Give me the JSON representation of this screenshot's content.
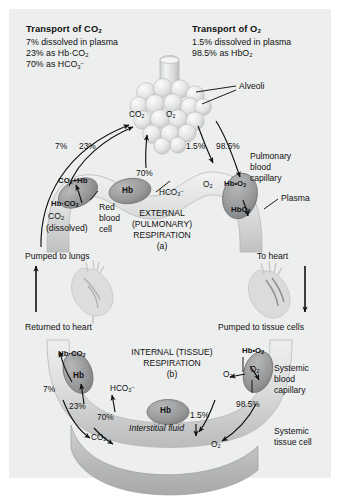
{
  "figure": {
    "title_co2": "Transport of CO2",
    "title_o2": "Transport of O2",
    "co2_facts": [
      "7% dissolved in plasma",
      "23% as Hb·CO2",
      "70% as HCO3-"
    ],
    "o2_facts": [
      "1.5% dissolved in plasma",
      "98.5% as HbO2"
    ]
  },
  "top_loop": {
    "caption_line1": "EXTERNAL",
    "caption_line2": "(PULMONARY)",
    "caption_line3": "RESPIRATION",
    "caption_letter": "(a)",
    "alveoli_label": "Alveoli",
    "capillary_label_l1": "Pulmonary",
    "capillary_label_l2": "blood",
    "capillary_label_l3": "capillary",
    "plasma_label": "Plasma",
    "rbc_l1": "Red",
    "rbc_l2": "blood",
    "rbc_l3": "cell",
    "gas_co2": "CO2",
    "gas_o2": "O2",
    "co2_plus_hb": "CO2+Hb",
    "hb_co2": "Hb·CO2",
    "co2_dissolved_l1": "CO2",
    "co2_dissolved_l2": "(dissolved)",
    "hb": "Hb",
    "hco3": "HCO3-",
    "o2_plasma": "O2",
    "hb_dot_o2": "Hb•O2",
    "hbo2": "HbO2",
    "pct_7": "7%",
    "pct_23": "23%",
    "pct_70": "70%",
    "pct_15": "1.5%",
    "pct_985": "98.5%"
  },
  "heart_row": {
    "pumped_to_lungs": "Pumped to lungs",
    "to_heart": "To heart",
    "returned_to_heart": "Returned to heart",
    "pumped_to_tissue": "Pumped to tissue cells"
  },
  "bottom_loop": {
    "caption_line1": "INTERNAL (TISSUE)",
    "caption_line2": "RESPIRATION",
    "caption_letter": "(b)",
    "capillary_label_l1": "Systemic",
    "capillary_label_l2": "blood",
    "capillary_label_l3": "capillary",
    "tissue_label_l1": "Systemic",
    "tissue_label_l2": "tissue cell",
    "interstitial_fluid": "Interstitial fluid",
    "hb_co2": "Hb·CO2",
    "hb": "Hb",
    "hco3": "HCO3-",
    "co2": "CO2",
    "hb_dot_o2": "Hb•O2",
    "o2_rbc": "O2",
    "o2_plasma": "O2",
    "o2_tissue": "O2",
    "pct_7": "7%",
    "pct_23": "23%",
    "pct_70": "70%",
    "pct_15": "1.5%",
    "pct_985": "98.5%"
  },
  "colors": {
    "panel_bg": "#edeeee",
    "vessel_light": "#e2e3e3",
    "vessel_mid": "#c6c8c8",
    "rbc_fill": "#9b9d9e",
    "rbc_edge": "#6f7172",
    "alveoli_fill": "#dedfdf",
    "tissue_fill": "#bdbfc0",
    "ink": "#111111"
  }
}
